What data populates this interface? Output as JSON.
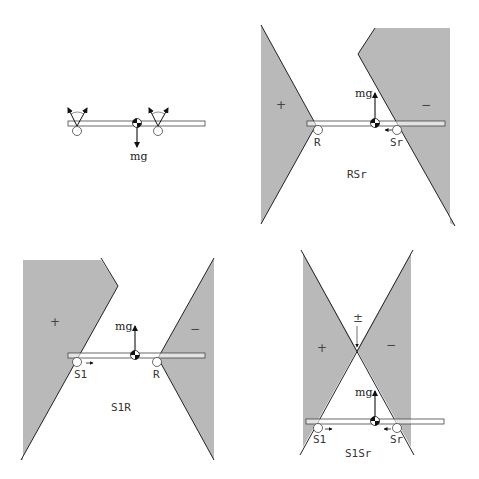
{
  "colors": {
    "region_fill": "#b9b9b9",
    "line": "#222222",
    "bar_fill": "#ffffff"
  },
  "panels": [
    {
      "id": "free-body",
      "force_label": "mg",
      "contacts": [],
      "region_label": ""
    },
    {
      "id": "RSr",
      "force_label": "mg",
      "contacts": [
        "R",
        "Sr"
      ],
      "signs": [
        "+",
        "−"
      ],
      "region_label": "RSr"
    },
    {
      "id": "S1R",
      "force_label": "mg",
      "contacts": [
        "S1",
        "R"
      ],
      "signs": [
        "+",
        "−"
      ],
      "region_label": "S1R"
    },
    {
      "id": "S1Sr",
      "force_label": "mg",
      "contacts": [
        "S1",
        "Sr"
      ],
      "signs": [
        "+",
        "−",
        "±"
      ],
      "region_label": "S1Sr"
    }
  ]
}
